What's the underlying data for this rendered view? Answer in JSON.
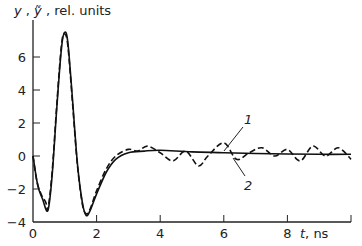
{
  "chart_data": {
    "type": "line",
    "title": "",
    "ylabel": "y , ỹ , rel. units",
    "xlabel": "t, ns",
    "xlim": [
      0,
      10
    ],
    "ylim": [
      -4,
      7.5
    ],
    "x_ticks": [
      0,
      2,
      4,
      6,
      8
    ],
    "y_ticks": [
      -4,
      -2,
      0,
      2,
      4,
      6
    ],
    "grid": false,
    "legend": "curve annotations 1 (solid) and 2 (dashed)",
    "series": [
      {
        "name": "1",
        "style": "solid",
        "x": [
          0,
          0.15,
          0.3,
          0.47,
          0.6,
          0.75,
          0.9,
          1.0,
          1.1,
          1.25,
          1.4,
          1.55,
          1.67,
          1.8,
          2.0,
          2.3,
          2.6,
          3.0,
          3.5,
          4.0,
          5.0,
          6.0,
          7.0,
          8.0,
          9.0,
          10.0
        ],
        "values": [
          0,
          -1.8,
          -2.6,
          -3.3,
          -1.2,
          3.0,
          6.6,
          7.5,
          6.8,
          3.2,
          -0.5,
          -2.8,
          -3.6,
          -3.3,
          -2.3,
          -1.0,
          -0.2,
          0.2,
          0.3,
          0.35,
          0.25,
          0.2,
          0.15,
          0.12,
          0.1,
          0.1
        ]
      },
      {
        "name": "2",
        "style": "dashed",
        "x": [
          0,
          0.12,
          0.25,
          0.4,
          0.47,
          0.6,
          0.75,
          0.9,
          1.0,
          1.1,
          1.25,
          1.4,
          1.55,
          1.67,
          1.8,
          2.0,
          2.3,
          2.6,
          3.0,
          3.3,
          3.6,
          4.0,
          4.4,
          4.8,
          5.2,
          5.5,
          6.0,
          6.4,
          6.8,
          7.2,
          7.6,
          8.0,
          8.4,
          8.8,
          9.2,
          9.6,
          10.0
        ],
        "values": [
          0,
          -1.5,
          -2.3,
          -2.8,
          -3.2,
          -1.0,
          3.2,
          6.8,
          7.4,
          6.6,
          3.0,
          -0.6,
          -2.9,
          -3.5,
          -3.2,
          -2.1,
          -0.8,
          0.0,
          0.4,
          0.3,
          0.6,
          0.2,
          -0.3,
          0.3,
          -0.6,
          0.0,
          0.8,
          -0.2,
          0.2,
          0.5,
          0.0,
          0.4,
          -0.3,
          0.6,
          0.0,
          0.5,
          -0.2
        ]
      }
    ],
    "annotations": [
      {
        "text": "1",
        "target_series": "1"
      },
      {
        "text": "2",
        "target_series": "2"
      }
    ]
  },
  "axes": {
    "y_label_parts": [
      "y",
      "ỹ",
      "rel. units"
    ],
    "x_label_parts": [
      "t",
      "ns"
    ],
    "x_tick_labels": [
      "0",
      "2",
      "4",
      "6",
      "8"
    ],
    "y_tick_labels": [
      "6",
      "4",
      "2",
      "0",
      "−2",
      "−4"
    ]
  },
  "colors": {
    "line": "#111111",
    "axis": "#222222",
    "background": "#ffffff"
  }
}
